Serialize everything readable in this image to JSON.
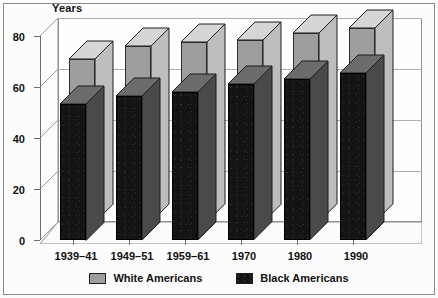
{
  "chart_data": {
    "type": "bar",
    "title": "",
    "subtitle": "",
    "ylabel": "Years",
    "xlabel": "",
    "ylim": [
      0,
      80
    ],
    "yticks": [
      0,
      20,
      40,
      60,
      80
    ],
    "ytick_labels": [
      "0",
      "20",
      "40",
      "60",
      "80"
    ],
    "grid": true,
    "grid_axis": "y",
    "legend_position": "bottom-center",
    "three_d": true,
    "categories": [
      "1939–41",
      "1949–51",
      "1959–61",
      "1970",
      "1980",
      "1990"
    ],
    "series": [
      {
        "name": "White Americans",
        "color": "#9e9e9e",
        "values": [
          64.0,
          69.0,
          70.5,
          71.5,
          74.0,
          76.0
        ]
      },
      {
        "name": "Black Americans",
        "color": "#141414",
        "values": [
          53.5,
          56.5,
          58.0,
          61.0,
          63.0,
          65.5
        ]
      }
    ],
    "legend": [
      {
        "label": "White Americans",
        "swatch": "white-swatch",
        "color": "#9e9e9e"
      },
      {
        "label": "Black Americans",
        "swatch": "black-swatch",
        "color": "#141414"
      }
    ]
  },
  "colors": {
    "page_background": "#fcfcfc",
    "frame_border": "#8a8a8a",
    "axis": "#6e6e6e",
    "gridline": "#adadad",
    "white_series": "#9e9e9e",
    "black_series": "#141414",
    "text": "#111111"
  }
}
